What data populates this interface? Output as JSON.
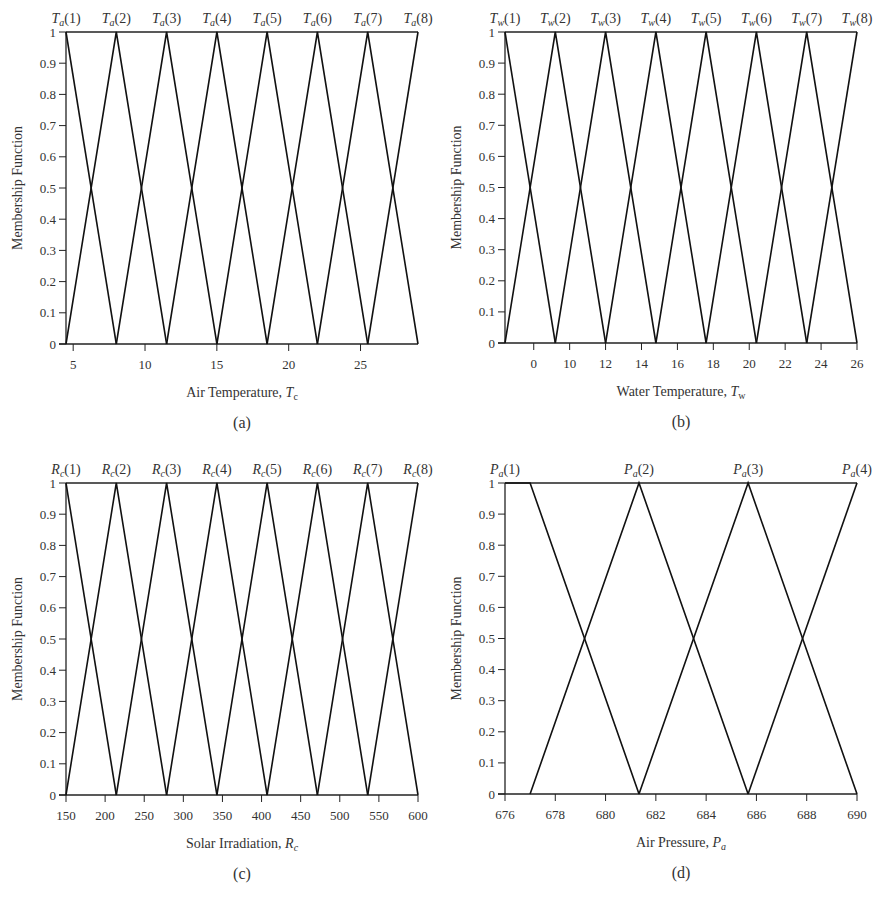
{
  "figure": {
    "y_axis_title": "Membership Function"
  },
  "chart_data": [
    {
      "id": "a",
      "type": "line",
      "panel_label": "(a)",
      "title": "",
      "xlabel": "Air Temperature, T_c",
      "xlabel_main": "Air Temperature, ",
      "xlabel_sym": "T",
      "xlabel_sub": "c",
      "ylabel": "Membership Function",
      "xlim": [
        4.5,
        29
      ],
      "ylim": [
        0,
        1
      ],
      "xticks": [
        5,
        10,
        15,
        20,
        25
      ],
      "xtick_labels": [
        "5",
        "10",
        "15",
        "20",
        "25"
      ],
      "yticks": [
        0,
        0.1,
        0.2,
        0.3,
        0.4,
        0.5,
        0.6,
        0.7,
        0.8,
        0.9,
        1
      ],
      "ytick_labels": [
        "0",
        "0.1",
        "0.2",
        "0.3",
        "0.4",
        "0.5",
        "0.6",
        "0.7",
        "0.8",
        "0.9",
        "1"
      ],
      "grid": false,
      "legend_position": "top (labels above each peak)",
      "sets_prefix": "T",
      "sets_sub": "a",
      "series": [
        {
          "name": "Ta(1)",
          "x": [
            4.5,
            4.5,
            8.0
          ],
          "y": [
            1,
            1,
            0
          ]
        },
        {
          "name": "Ta(2)",
          "x": [
            4.5,
            8.0,
            11.5
          ],
          "y": [
            0,
            1,
            0
          ]
        },
        {
          "name": "Ta(3)",
          "x": [
            8.0,
            11.5,
            15.0
          ],
          "y": [
            0,
            1,
            0
          ]
        },
        {
          "name": "Ta(4)",
          "x": [
            11.5,
            15.0,
            18.5
          ],
          "y": [
            0,
            1,
            0
          ]
        },
        {
          "name": "Ta(5)",
          "x": [
            15.0,
            18.5,
            22.0
          ],
          "y": [
            0,
            1,
            0
          ]
        },
        {
          "name": "Ta(6)",
          "x": [
            18.5,
            22.0,
            25.5
          ],
          "y": [
            0,
            1,
            0
          ]
        },
        {
          "name": "Ta(7)",
          "x": [
            22.0,
            25.5,
            29.0
          ],
          "y": [
            0,
            1,
            0
          ]
        },
        {
          "name": "Ta(8)",
          "x": [
            25.5,
            29.0,
            29.0
          ],
          "y": [
            0,
            1,
            1
          ]
        }
      ],
      "peaks": [
        4.5,
        8.0,
        11.5,
        15.0,
        18.5,
        22.0,
        25.5,
        29.0
      ],
      "set_labels": [
        "(1)",
        "(2)",
        "(3)",
        "(4)",
        "(5)",
        "(6)",
        "(7)",
        "(8)"
      ]
    },
    {
      "id": "b",
      "type": "line",
      "panel_label": "(b)",
      "title": "",
      "xlabel": "Water Temperature, T_w",
      "xlabel_main": "Water Temperature, ",
      "xlabel_sym": "T",
      "xlabel_sub": "w",
      "ylabel": "Membership Function",
      "xlim": [
        6.4,
        26
      ],
      "ylim": [
        0,
        1
      ],
      "xticks": [
        8,
        10,
        12,
        14,
        16,
        18,
        20,
        22,
        24,
        26
      ],
      "xtick_labels": [
        "0",
        "10",
        "12",
        "14",
        "16",
        "18",
        "20",
        "22",
        "24",
        "26"
      ],
      "yticks": [
        0,
        0.1,
        0.2,
        0.3,
        0.4,
        0.5,
        0.6,
        0.7,
        0.8,
        0.9,
        1
      ],
      "ytick_labels": [
        "0",
        "0.1",
        "0.2",
        "0.3",
        "0.4",
        "0.5",
        "0.6",
        "0.7",
        "0.8",
        "0.9",
        "1"
      ],
      "grid": false,
      "legend_position": "top (labels above each peak)",
      "sets_prefix": "T",
      "sets_sub": "w",
      "series": [
        {
          "name": "Tw(1)",
          "x": [
            6.4,
            6.4,
            9.2
          ],
          "y": [
            1,
            1,
            0
          ]
        },
        {
          "name": "Tw(2)",
          "x": [
            6.4,
            9.2,
            12.0
          ],
          "y": [
            0,
            1,
            0
          ]
        },
        {
          "name": "Tw(3)",
          "x": [
            9.2,
            12.0,
            14.8
          ],
          "y": [
            0,
            1,
            0
          ]
        },
        {
          "name": "Tw(4)",
          "x": [
            12.0,
            14.8,
            17.6
          ],
          "y": [
            0,
            1,
            0
          ]
        },
        {
          "name": "Tw(5)",
          "x": [
            14.8,
            17.6,
            20.4
          ],
          "y": [
            0,
            1,
            0
          ]
        },
        {
          "name": "Tw(6)",
          "x": [
            17.6,
            20.4,
            23.2
          ],
          "y": [
            0,
            1,
            0
          ]
        },
        {
          "name": "Tw(7)",
          "x": [
            20.4,
            23.2,
            26.0
          ],
          "y": [
            0,
            1,
            0
          ]
        },
        {
          "name": "Tw(8)",
          "x": [
            23.2,
            26.0,
            26.0
          ],
          "y": [
            0,
            1,
            1
          ]
        }
      ],
      "peaks": [
        6.4,
        9.2,
        12.0,
        14.8,
        17.6,
        20.4,
        23.2,
        26.0
      ],
      "set_labels": [
        "(1)",
        "(2)",
        "(3)",
        "(4)",
        "(5)",
        "(6)",
        "(7)",
        "(8)"
      ]
    },
    {
      "id": "c",
      "type": "line",
      "panel_label": "(c)",
      "title": "",
      "xlabel": "Solar Irradiation, R_c",
      "xlabel_main": "Solar Irradiation, ",
      "xlabel_sym": "R",
      "xlabel_sub": "c",
      "ylabel": "Membership Function",
      "xlim": [
        150,
        600
      ],
      "ylim": [
        0,
        1
      ],
      "xticks": [
        150,
        200,
        250,
        300,
        350,
        400,
        450,
        500,
        550,
        600
      ],
      "xtick_labels": [
        "150",
        "200",
        "250",
        "300",
        "350",
        "400",
        "450",
        "500",
        "550",
        "600"
      ],
      "yticks": [
        0,
        0.1,
        0.2,
        0.3,
        0.4,
        0.5,
        0.6,
        0.7,
        0.8,
        0.9,
        1
      ],
      "ytick_labels": [
        "0",
        "0.1",
        "0.2",
        "0.3",
        "0.4",
        "0.5",
        "0.6",
        "0.7",
        "0.8",
        "0.9",
        "1"
      ],
      "grid": false,
      "legend_position": "top (labels above each peak)",
      "sets_prefix": "R",
      "sets_sub": "c",
      "series": [
        {
          "name": "Rc(1)",
          "x": [
            150,
            150,
            214.3
          ],
          "y": [
            1,
            1,
            0
          ]
        },
        {
          "name": "Rc(2)",
          "x": [
            150,
            214.3,
            278.6
          ],
          "y": [
            0,
            1,
            0
          ]
        },
        {
          "name": "Rc(3)",
          "x": [
            214.3,
            278.6,
            342.9
          ],
          "y": [
            0,
            1,
            0
          ]
        },
        {
          "name": "Rc(4)",
          "x": [
            278.6,
            342.9,
            407.1
          ],
          "y": [
            0,
            1,
            0
          ]
        },
        {
          "name": "Rc(5)",
          "x": [
            342.9,
            407.1,
            471.4
          ],
          "y": [
            0,
            1,
            0
          ]
        },
        {
          "name": "Rc(6)",
          "x": [
            407.1,
            471.4,
            535.7
          ],
          "y": [
            0,
            1,
            0
          ]
        },
        {
          "name": "Rc(7)",
          "x": [
            471.4,
            535.7,
            600
          ],
          "y": [
            0,
            1,
            0
          ]
        },
        {
          "name": "Rc(8)",
          "x": [
            535.7,
            600,
            600
          ],
          "y": [
            0,
            1,
            1
          ]
        }
      ],
      "peaks": [
        150,
        214.3,
        278.6,
        342.9,
        407.1,
        471.4,
        535.7,
        600
      ],
      "set_labels": [
        "(1)",
        "(2)",
        "(3)",
        "(4)",
        "(5)",
        "(6)",
        "(7)",
        "(8)"
      ]
    },
    {
      "id": "d",
      "type": "line",
      "panel_label": "(d)",
      "title": "",
      "xlabel": "Air Pressure, P_a",
      "xlabel_main": "Air Pressure, ",
      "xlabel_sym": "P",
      "xlabel_sub": "a",
      "ylabel": "Membership Function",
      "xlim": [
        676,
        690
      ],
      "ylim": [
        0,
        1
      ],
      "xticks": [
        676,
        678,
        680,
        682,
        684,
        686,
        688,
        690
      ],
      "xtick_labels": [
        "676",
        "678",
        "680",
        "682",
        "684",
        "686",
        "688",
        "690"
      ],
      "yticks": [
        0,
        0.1,
        0.2,
        0.3,
        0.4,
        0.5,
        0.6,
        0.7,
        0.8,
        0.9,
        1
      ],
      "ytick_labels": [
        "0",
        "0.1",
        "0.2",
        "0.3",
        "0.4",
        "0.5",
        "0.6",
        "0.7",
        "0.8",
        "0.9",
        "1"
      ],
      "grid": false,
      "legend_position": "top (labels above each peak)",
      "sets_prefix": "P",
      "sets_sub": "a",
      "series": [
        {
          "name": "Pa(1)",
          "x": [
            676,
            677,
            681.33
          ],
          "y": [
            1,
            1,
            0
          ]
        },
        {
          "name": "Pa(2)",
          "x": [
            677,
            681.33,
            685.67
          ],
          "y": [
            0,
            1,
            0
          ]
        },
        {
          "name": "Pa(3)",
          "x": [
            681.33,
            685.67,
            690
          ],
          "y": [
            0,
            1,
            0
          ]
        },
        {
          "name": "Pa(4)",
          "x": [
            685.67,
            690,
            690
          ],
          "y": [
            0,
            1,
            1
          ]
        }
      ],
      "peaks": [
        676,
        681.33,
        685.67,
        690
      ],
      "label_x": [
        676,
        681.33,
        685.67,
        690
      ],
      "set_labels": [
        "(1)",
        "(2)",
        "(3)",
        "(4)"
      ]
    }
  ]
}
